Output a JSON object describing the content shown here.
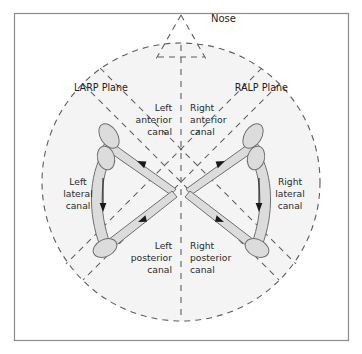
{
  "figure": {
    "title_text": "Nose",
    "background_color": "#ffffff",
    "frame_color": "#8c8c8c",
    "head_fill": "#f4f4f4",
    "dash_color": "#5d5d5d",
    "canal_fill": "#dcdcdc",
    "canal_stroke": "#6f6f6f",
    "arrow_color": "#1a1a1a",
    "text_color": "#2b2b2b"
  },
  "labels": {
    "nose": "Nose",
    "larp_plane": "LARP Plane",
    "ralp_plane": "RALP Plane",
    "left_anterior": [
      "Left",
      "anterior",
      "canal"
    ],
    "right_anterior": [
      "Right",
      "anterior",
      "canal"
    ],
    "left_posterior": [
      "Left",
      "posterior",
      "canal"
    ],
    "right_posterior": [
      "Right",
      "posterior",
      "canal"
    ],
    "left_lateral": [
      "Left",
      "lateral",
      "canal"
    ],
    "right_lateral": [
      "Right",
      "lateral",
      "canal"
    ]
  },
  "structures": {
    "left_labyrinth": {
      "anterior_canal": "left-anterior-canal",
      "posterior_canal": "left-posterior-canal",
      "lateral_canal": "left-lateral-canal",
      "ampullae_count": 3,
      "flow_direction": "ampullofugal"
    },
    "right_labyrinth": {
      "anterior_canal": "right-anterior-canal",
      "posterior_canal": "right-posterior-canal",
      "lateral_canal": "right-lateral-canal",
      "ampullae_count": 3,
      "flow_direction": "ampullofugal"
    },
    "planes": [
      "LARP",
      "RALP",
      "midsagittal"
    ]
  }
}
